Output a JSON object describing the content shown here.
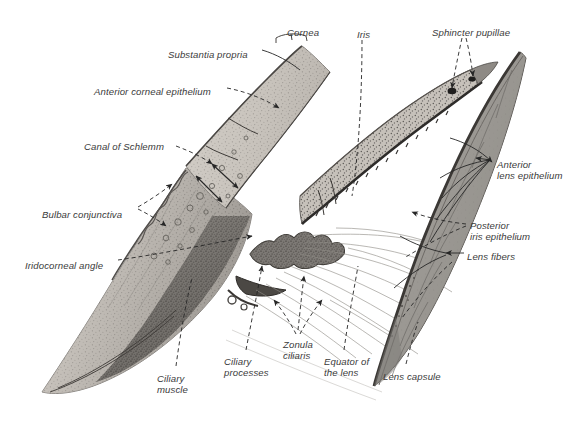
{
  "figure": {
    "background_color": "#ffffff",
    "label_color": "#3a3a3a",
    "leader_color": "#2b2b2b",
    "width": 583,
    "height": 430
  },
  "palette": {
    "sclera_light": "#cfcac4",
    "sclera_mid": "#a9a49e",
    "sclera_dark": "#6f6b67",
    "cornea_fill": "#c9c4bd",
    "iris_fill": "#c2bdb6",
    "lens_fill": "#9d9a95",
    "lens_capsule": "#4a4743",
    "outline": "#5a5754",
    "zonule": "#8e8b86"
  },
  "labels": [
    {
      "id": "cornea",
      "text": "Cornea",
      "x": 287,
      "y": 27,
      "align": "left"
    },
    {
      "id": "substantia-propria",
      "text": "Substantia propria",
      "x": 168,
      "y": 49,
      "align": "left"
    },
    {
      "id": "anterior-corneal-epithelium",
      "text": "Anterior corneal epithelium",
      "x": 94,
      "y": 86,
      "align": "left"
    },
    {
      "id": "canal-of-schlemm",
      "text": "Canal of Schlemm",
      "x": 84,
      "y": 141,
      "align": "left"
    },
    {
      "id": "bulbar-conjunctiva",
      "text": "Bulbar conjunctiva",
      "x": 42,
      "y": 209,
      "align": "left"
    },
    {
      "id": "iridocorneal-angle",
      "text": "Iridocorneal angle",
      "x": 25,
      "y": 260,
      "align": "left"
    },
    {
      "id": "ciliary-muscle",
      "text": "Ciliary\nmuscle",
      "x": 157,
      "y": 373,
      "align": "left"
    },
    {
      "id": "ciliary-processes",
      "text": "Ciliary\nprocesses",
      "x": 224,
      "y": 356,
      "align": "left"
    },
    {
      "id": "zonula-ciliaris",
      "text": "Zonula\nciliaris",
      "x": 283,
      "y": 339,
      "align": "left"
    },
    {
      "id": "equator-of-the-lens",
      "text": "Equator of\nthe lens",
      "x": 324,
      "y": 356,
      "align": "left"
    },
    {
      "id": "lens-capsule",
      "text": "Lens capsule",
      "x": 383,
      "y": 371,
      "align": "left"
    },
    {
      "id": "iris",
      "text": "Iris",
      "x": 357,
      "y": 29,
      "align": "left"
    },
    {
      "id": "sphincter-pupillae",
      "text": "Sphincter pupillae",
      "x": 432,
      "y": 27,
      "align": "left"
    },
    {
      "id": "anterior-lens-epithelium",
      "text": "Anterior\nlens epithelium",
      "x": 497,
      "y": 159,
      "align": "left"
    },
    {
      "id": "posterior-iris-epithelium",
      "text": "Posterior\niris epithelium",
      "x": 470,
      "y": 220,
      "align": "left"
    },
    {
      "id": "lens-fibers",
      "text": "Lens fibers",
      "x": 467,
      "y": 251,
      "align": "left"
    }
  ],
  "structures": [
    {
      "id": "cornea",
      "name": "Cornea"
    },
    {
      "id": "sclera",
      "name": "Sclera"
    },
    {
      "id": "conjunctiva",
      "name": "Bulbar conjunctiva"
    },
    {
      "id": "iris",
      "name": "Iris"
    },
    {
      "id": "ciliary-body",
      "name": "Ciliary body and muscle"
    },
    {
      "id": "ciliary-process",
      "name": "Ciliary processes"
    },
    {
      "id": "zonule",
      "name": "Zonula ciliaris (suspensory ligament)"
    },
    {
      "id": "lens",
      "name": "Lens"
    }
  ]
}
